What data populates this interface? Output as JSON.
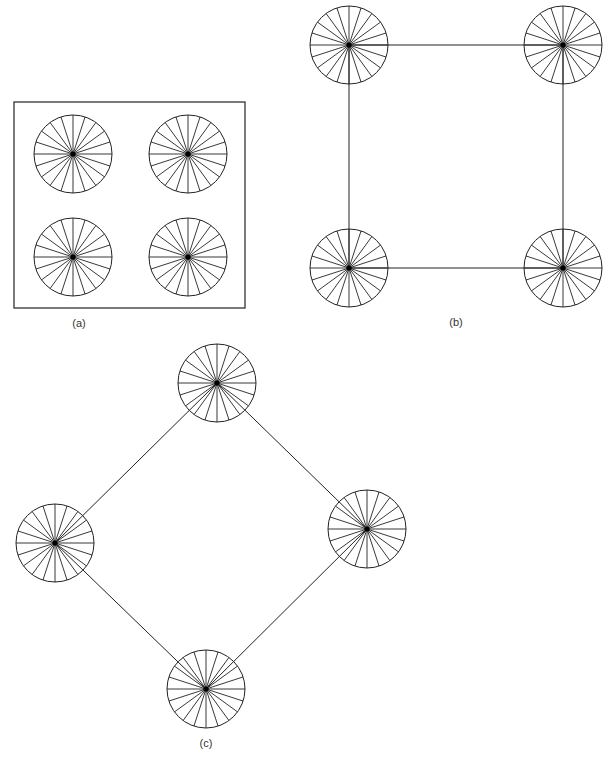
{
  "figure": {
    "stroke_color": "#222222",
    "hub_color": "#000000",
    "background": "#ffffff",
    "spokes_per_wheel": 20,
    "panels": [
      {
        "id": "a",
        "label": "(a)",
        "label_pos": [
          79,
          324
        ],
        "frame": {
          "x": 14,
          "y": 102,
          "w": 231,
          "h": 206
        },
        "wheels": [
          {
            "cx": 73,
            "cy": 154,
            "r": 39
          },
          {
            "cx": 188,
            "cy": 154,
            "r": 39
          },
          {
            "cx": 73,
            "cy": 257,
            "r": 39
          },
          {
            "cx": 188,
            "cy": 257,
            "r": 39
          }
        ],
        "edges": []
      },
      {
        "id": "b",
        "label": "(b)",
        "label_pos": [
          456,
          323
        ],
        "frame": null,
        "wheels": [
          {
            "cx": 349,
            "cy": 45,
            "r": 39
          },
          {
            "cx": 563,
            "cy": 45,
            "r": 39
          },
          {
            "cx": 349,
            "cy": 268,
            "r": 39
          },
          {
            "cx": 563,
            "cy": 268,
            "r": 39
          }
        ],
        "edges": [
          [
            0,
            1
          ],
          [
            1,
            3
          ],
          [
            3,
            2
          ],
          [
            2,
            0
          ]
        ]
      },
      {
        "id": "c",
        "label": "(c)",
        "label_pos": [
          206,
          744
        ],
        "frame": null,
        "wheels": [
          {
            "cx": 217,
            "cy": 383,
            "r": 39
          },
          {
            "cx": 55,
            "cy": 543,
            "r": 39
          },
          {
            "cx": 367,
            "cy": 529,
            "r": 39
          },
          {
            "cx": 206,
            "cy": 689,
            "r": 39
          }
        ],
        "edges": [
          [
            0,
            1
          ],
          [
            0,
            2
          ],
          [
            1,
            3
          ],
          [
            2,
            3
          ]
        ]
      }
    ]
  }
}
